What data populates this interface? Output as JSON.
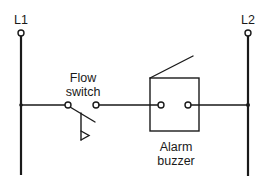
{
  "diagram": {
    "type": "ladder-wiring-diagram",
    "colors": {
      "line": "#1a1a1a",
      "background": "#ffffff"
    },
    "rails": [
      {
        "id": "L1",
        "label": "L1"
      },
      {
        "id": "L2",
        "label": "L2"
      }
    ],
    "components": {
      "flow_switch": {
        "label_line1": "Flow",
        "label_line2": "switch"
      },
      "alarm_buzzer": {
        "label_line1": "Alarm",
        "label_line2": "buzzer"
      }
    }
  }
}
